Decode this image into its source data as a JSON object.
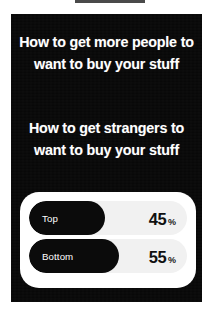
{
  "background_color": "#ffffff",
  "story": {
    "panel_color": "#080808",
    "text_color": "#ffffff",
    "headline_primary": "How to get more people to want to buy your stuff",
    "headline_secondary": "How to get strangers to want to buy your stuff"
  },
  "poll": {
    "card_color": "#ffffff",
    "track_color": "#f1f1f1",
    "fill_color": "#0b0b0b",
    "percent_sign": "%",
    "options": [
      {
        "label": "Top",
        "percent": "45",
        "fill_pct": 48
      },
      {
        "label": "Bottom",
        "percent": "55",
        "fill_pct": 57
      }
    ]
  },
  "chart_data": {
    "type": "bar",
    "title": "",
    "categories": [
      "Top",
      "Bottom"
    ],
    "values": [
      45,
      55
    ],
    "xlabel": "",
    "ylabel": "Share of votes (%)",
    "ylim": [
      0,
      100
    ],
    "orientation": "horizontal",
    "grid": false,
    "legend": "none",
    "data_labels": [
      "45 %",
      "55 %"
    ]
  }
}
